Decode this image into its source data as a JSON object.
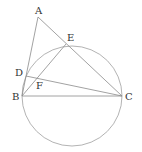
{
  "diagram": {
    "type": "geometry",
    "points": {
      "A": {
        "label": "A",
        "x": 38,
        "y": 17,
        "lx": 35,
        "ly": 14
      },
      "E": {
        "label": "E",
        "x": 66,
        "y": 44,
        "lx": 67,
        "ly": 41
      },
      "D": {
        "label": "D",
        "x": 26,
        "y": 76,
        "lx": 15,
        "ly": 76
      },
      "F": {
        "label": "F",
        "x": 39,
        "y": 80,
        "lx": 36,
        "ly": 89
      },
      "B": {
        "label": "B",
        "x": 22,
        "y": 96,
        "lx": 12,
        "ly": 100
      },
      "C": {
        "label": "C",
        "x": 122,
        "y": 96,
        "lx": 125,
        "ly": 100
      }
    },
    "circle": {
      "cx": 72,
      "cy": 96,
      "r": 50
    },
    "segments": [
      "AB",
      "AC",
      "BE",
      "BC",
      "DC"
    ],
    "colors": {
      "line": "#8a8a8a",
      "circle": "#a0a0a0",
      "text": "#333333"
    }
  }
}
